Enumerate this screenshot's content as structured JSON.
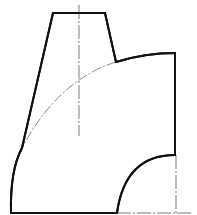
{
  "drawing": {
    "type": "technical-drawing",
    "subject": "reducing elbow / transition piece (orthographic view)",
    "colors": {
      "outline": "#111111",
      "center_line": "#444444",
      "phantom_line": "#555555",
      "background": "#ffffff"
    },
    "elements": [
      {
        "name": "top-neck-trapezoid",
        "kind": "solid-outline"
      },
      {
        "name": "outer-elbow-arc",
        "kind": "solid-outline"
      },
      {
        "name": "right-vertical-edge",
        "kind": "solid-outline"
      },
      {
        "name": "inner-elbow-arc",
        "kind": "solid-outline"
      },
      {
        "name": "bottom-base-edge",
        "kind": "solid-outline"
      },
      {
        "name": "left-outer-curve",
        "kind": "solid-outline"
      },
      {
        "name": "vertical-center-line",
        "kind": "dash-dot"
      },
      {
        "name": "hidden-intersection-arc",
        "kind": "dash-dot"
      },
      {
        "name": "right-center-line",
        "kind": "dash-dot"
      },
      {
        "name": "base-center-line-extension",
        "kind": "dash-dot"
      }
    ]
  }
}
